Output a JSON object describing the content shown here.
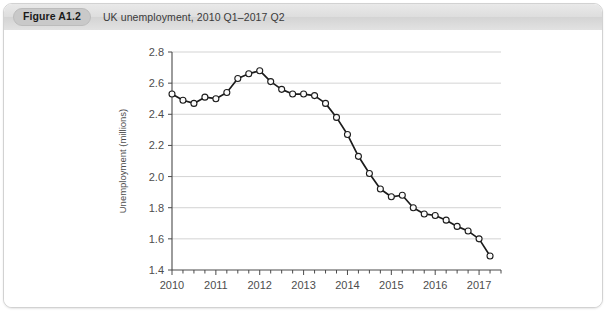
{
  "figure": {
    "number_label": "Figure A1.2",
    "caption": "UK unemployment, 2010 Q1–2017 Q2"
  },
  "chart_data": {
    "type": "line",
    "title": "UK unemployment, 2010 Q1–2017 Q2",
    "xlabel": "",
    "ylabel": "Unemployment (millions)",
    "xlim": [
      2010.0,
      2017.5
    ],
    "ylim": [
      1.4,
      2.8
    ],
    "grid": true,
    "legend": "none",
    "marker": "open-circle",
    "y_ticks": [
      1.4,
      1.6,
      1.8,
      2.0,
      2.2,
      2.4,
      2.6,
      2.8
    ],
    "y_tick_labels": [
      "1.4",
      "1.6",
      "1.8",
      "2.0",
      "2.2",
      "2.4",
      "2.6",
      "2.8"
    ],
    "x_ticks": [
      2010,
      2011,
      2012,
      2013,
      2014,
      2015,
      2016,
      2017
    ],
    "x_tick_labels": [
      "2010",
      "2011",
      "2012",
      "2013",
      "2014",
      "2015",
      "2016",
      "2017"
    ],
    "x_minor_tick_interval_years": 0.25,
    "x": [
      2010.0,
      2010.25,
      2010.5,
      2010.75,
      2011.0,
      2011.25,
      2011.5,
      2011.75,
      2012.0,
      2012.25,
      2012.5,
      2012.75,
      2013.0,
      2013.25,
      2013.5,
      2013.75,
      2014.0,
      2014.25,
      2014.5,
      2014.75,
      2015.0,
      2015.25,
      2015.5,
      2015.75,
      2016.0,
      2016.25,
      2016.5,
      2016.75,
      2017.0,
      2017.25
    ],
    "x_quarter_labels": [
      "2010 Q1",
      "2010 Q2",
      "2010 Q3",
      "2010 Q4",
      "2011 Q1",
      "2011 Q2",
      "2011 Q3",
      "2011 Q4",
      "2012 Q1",
      "2012 Q2",
      "2012 Q3",
      "2012 Q4",
      "2013 Q1",
      "2013 Q2",
      "2013 Q3",
      "2013 Q4",
      "2014 Q1",
      "2014 Q2",
      "2014 Q3",
      "2014 Q4",
      "2015 Q1",
      "2015 Q2",
      "2015 Q3",
      "2015 Q4",
      "2016 Q1",
      "2016 Q2",
      "2016 Q3",
      "2016 Q4",
      "2017 Q1",
      "2017 Q2"
    ],
    "values": [
      2.53,
      2.49,
      2.47,
      2.51,
      2.5,
      2.54,
      2.63,
      2.66,
      2.68,
      2.61,
      2.56,
      2.53,
      2.53,
      2.52,
      2.47,
      2.38,
      2.27,
      2.13,
      2.02,
      1.92,
      1.87,
      1.88,
      1.8,
      1.76,
      1.75,
      1.72,
      1.68,
      1.65,
      1.6,
      1.49
    ],
    "series": [
      {
        "name": "UK unemployment (millions)",
        "values": [
          2.53,
          2.49,
          2.47,
          2.51,
          2.5,
          2.54,
          2.63,
          2.66,
          2.68,
          2.61,
          2.56,
          2.53,
          2.53,
          2.52,
          2.47,
          2.38,
          2.27,
          2.13,
          2.02,
          1.92,
          1.87,
          1.88,
          1.8,
          1.76,
          1.75,
          1.72,
          1.68,
          1.65,
          1.6,
          1.49
        ],
        "color": "#1c1c1c"
      }
    ]
  }
}
